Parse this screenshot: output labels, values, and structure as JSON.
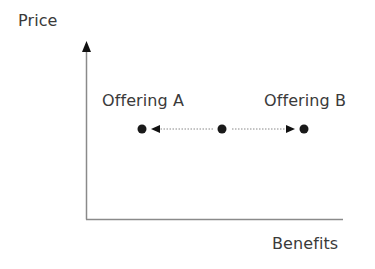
{
  "diagram": {
    "axes": {
      "y_label": "Price",
      "x_label": "Benefits"
    },
    "offerings": [
      {
        "id": "a",
        "label": "Offering A"
      },
      {
        "id": "b",
        "label": "Offering B"
      }
    ],
    "points": [
      {
        "name": "offering-a-point",
        "x": 142,
        "y": 129
      },
      {
        "name": "center-point",
        "x": 222,
        "y": 129
      },
      {
        "name": "offering-b-point",
        "x": 304,
        "y": 129
      }
    ],
    "arrows": [
      {
        "name": "arrow-to-offering-a",
        "from": "center",
        "to": "offering-a",
        "style": "dotted"
      },
      {
        "name": "arrow-to-offering-b",
        "from": "center",
        "to": "offering-b",
        "style": "dotted"
      }
    ],
    "colors": {
      "axis": "#8a8a8a",
      "text": "#3a3a3a",
      "point": "#1a1a1a",
      "dotted_line": "#888888"
    }
  }
}
